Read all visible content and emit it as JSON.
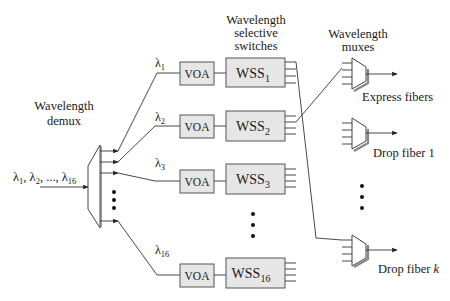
{
  "diagram": {
    "title_labels": {
      "demux": [
        "Wavelength",
        "demux"
      ],
      "wss": [
        "Wavelength",
        "selective",
        "switches"
      ],
      "muxes": [
        "Wavelength",
        "muxes"
      ]
    },
    "input": {
      "label_parts": [
        "λ",
        "1",
        ", λ",
        "2",
        ", ..., λ",
        "16"
      ]
    },
    "channels": [
      {
        "lambda": "λ",
        "sub": "1",
        "voa": "VOA",
        "wss": "WSS",
        "wss_sub": "1"
      },
      {
        "lambda": "λ",
        "sub": "2",
        "voa": "VOA",
        "wss": "WSS",
        "wss_sub": "2"
      },
      {
        "lambda": "λ",
        "sub": "3",
        "voa": "VOA",
        "wss": "WSS",
        "wss_sub": "3"
      },
      {
        "lambda": "λ",
        "sub": "16",
        "voa": "VOA",
        "wss": "WSS",
        "wss_sub": "16"
      }
    ],
    "outputs": [
      {
        "label": "Express fibers",
        "italic_suffix": ""
      },
      {
        "label": "Drop fiber 1",
        "italic_suffix": ""
      },
      {
        "label": "Drop fiber ",
        "italic_suffix": "k"
      }
    ],
    "ellipsis": "•"
  }
}
